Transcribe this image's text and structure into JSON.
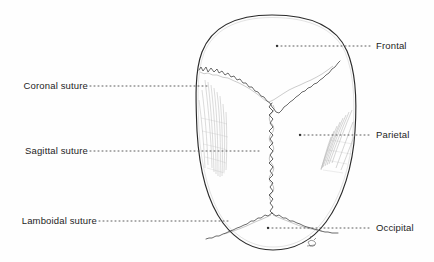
{
  "figure": {
    "background_color": "#fefefe",
    "ink_color": "#2b2b2b",
    "leader_color": "#555555",
    "shading_color": "#9a9a9a"
  },
  "labels": {
    "left": [
      {
        "text": "Coronal suture",
        "x": 88,
        "y": 86
      },
      {
        "text": "Sagittal suture",
        "x": 88,
        "y": 151
      },
      {
        "text": "Lamboidal suture",
        "x": 97,
        "y": 221
      }
    ],
    "right": [
      {
        "text": "Frontal",
        "x": 376,
        "y": 46
      },
      {
        "text": "Parietal",
        "x": 376,
        "y": 135
      },
      {
        "text": "Occipital",
        "x": 376,
        "y": 228
      }
    ]
  },
  "anatomy": {
    "bones": [
      "Frontal",
      "Parietal",
      "Occipital"
    ],
    "sutures": [
      "Coronal suture",
      "Sagittal suture",
      "Lamboidal suture"
    ],
    "view": "superior"
  }
}
